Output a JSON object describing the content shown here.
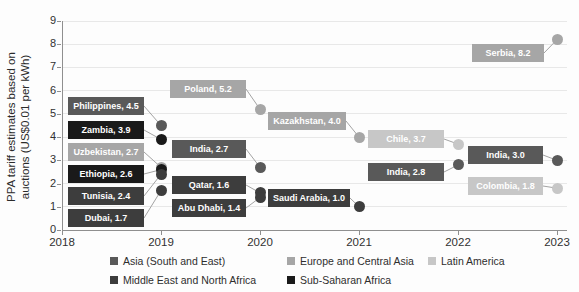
{
  "chart_data": {
    "type": "scatter",
    "title": "",
    "xlabel": "",
    "ylabel": "PPA tariff estimates based on auctions (US$0.01 per kWh)",
    "ylabel_line1": "PPA tariff estimates based on",
    "ylabel_line2": "auctions (US$0.01 per kWh)",
    "xlim": [
      2018,
      2023
    ],
    "ylim": [
      0,
      9
    ],
    "x_ticks": [
      "2018",
      "2019",
      "2020",
      "2021",
      "2022",
      "2023"
    ],
    "y_ticks": [
      "0",
      "1",
      "2",
      "3",
      "4",
      "5",
      "6",
      "7",
      "8",
      "9"
    ],
    "grid": "horizontal-light",
    "legend_position": "bottom",
    "categories": [
      {
        "name": "Asia (South and East)",
        "color": "#595959"
      },
      {
        "name": "Europe and Central Asia",
        "color": "#a6a6a6"
      },
      {
        "name": "Latin America",
        "color": "#c7c7c7"
      },
      {
        "name": "Middle East and North Africa",
        "color": "#3d3d3d"
      },
      {
        "name": "Sub-Saharan Africa",
        "color": "#1a1a1a"
      }
    ],
    "points": [
      {
        "country": "Philippines",
        "label": "Philippines, 4.5",
        "year": 2019,
        "value": 4.5,
        "category": 0,
        "box": {
          "x": 68,
          "y": 97,
          "w": 76,
          "h": 18
        }
      },
      {
        "country": "Zambia",
        "label": "Zambia, 3.9",
        "year": 2019,
        "value": 3.9,
        "category": 4,
        "box": {
          "x": 68,
          "y": 121,
          "w": 76,
          "h": 18
        }
      },
      {
        "country": "Uzbekistan",
        "label": "Uzbekistan, 2.7",
        "year": 2019,
        "value": 2.7,
        "category": 1,
        "box": {
          "x": 68,
          "y": 143,
          "w": 76,
          "h": 18
        }
      },
      {
        "country": "Ethiopia",
        "label": "Ethiopia, 2.6",
        "year": 2019,
        "value": 2.6,
        "category": 4,
        "box": {
          "x": 68,
          "y": 165,
          "w": 76,
          "h": 18
        }
      },
      {
        "country": "Tunisia",
        "label": "Tunisia, 2.4",
        "year": 2019,
        "value": 2.4,
        "category": 3,
        "box": {
          "x": 68,
          "y": 187,
          "w": 76,
          "h": 18
        }
      },
      {
        "country": "Dubai",
        "label": "Dubai, 1.7",
        "year": 2019,
        "value": 1.7,
        "category": 3,
        "box": {
          "x": 68,
          "y": 209,
          "w": 76,
          "h": 18
        }
      },
      {
        "country": "Poland",
        "label": "Poland, 5.2",
        "year": 2020,
        "value": 5.2,
        "category": 1,
        "box": {
          "x": 170,
          "y": 80,
          "w": 76,
          "h": 18
        }
      },
      {
        "country": "India",
        "label": "India, 2.7",
        "year": 2020,
        "value": 2.7,
        "category": 0,
        "box": {
          "x": 172,
          "y": 140,
          "w": 74,
          "h": 18
        }
      },
      {
        "country": "Qatar",
        "label": "Qatar, 1.6",
        "year": 2020,
        "value": 1.6,
        "category": 3,
        "box": {
          "x": 172,
          "y": 176,
          "w": 74,
          "h": 18
        }
      },
      {
        "country": "Abu Dhabi",
        "label": "Abu Dhabi, 1.4",
        "year": 2020,
        "value": 1.4,
        "category": 3,
        "box": {
          "x": 172,
          "y": 199,
          "w": 74,
          "h": 18
        }
      },
      {
        "country": "Kazakhstan",
        "label": "Kazakhstan, 4.0",
        "year": 2021,
        "value": 4.0,
        "category": 1,
        "box": {
          "x": 268,
          "y": 112,
          "w": 78,
          "h": 18
        }
      },
      {
        "country": "Saudi Arabia",
        "label": "Saudi Arabia, 1.0",
        "year": 2021,
        "value": 1.0,
        "category": 3,
        "box": {
          "x": 268,
          "y": 189,
          "w": 82,
          "h": 18
        }
      },
      {
        "country": "Chile",
        "label": "Chile, 3.7",
        "year": 2022,
        "value": 3.7,
        "category": 2,
        "box": {
          "x": 368,
          "y": 130,
          "w": 76,
          "h": 18
        }
      },
      {
        "country": "India",
        "label": "India, 2.8",
        "year": 2022,
        "value": 2.8,
        "category": 0,
        "box": {
          "x": 368,
          "y": 163,
          "w": 76,
          "h": 18
        }
      },
      {
        "country": "Serbia",
        "label": "Serbia, 8.2",
        "year": 2023,
        "value": 8.2,
        "category": 1,
        "box": {
          "x": 472,
          "y": 44,
          "w": 72,
          "h": 18
        }
      },
      {
        "country": "India",
        "label": "India, 3.0",
        "year": 2023,
        "value": 3.0,
        "category": 0,
        "box": {
          "x": 468,
          "y": 146,
          "w": 75,
          "h": 18
        }
      },
      {
        "country": "Colombia",
        "label": "Colombia, 1.8",
        "year": 2023,
        "value": 1.8,
        "category": 2,
        "box": {
          "x": 468,
          "y": 177,
          "w": 75,
          "h": 18
        }
      }
    ]
  }
}
